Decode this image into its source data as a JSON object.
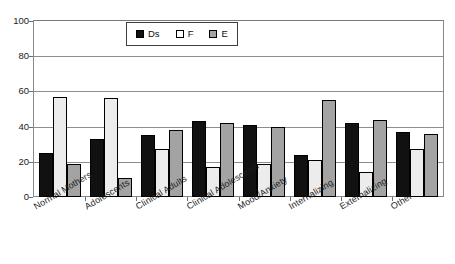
{
  "chart_data": {
    "type": "bar",
    "title": "",
    "xlabel": "",
    "ylabel": "",
    "ylim": [
      0,
      100
    ],
    "yticks": [
      0,
      20,
      40,
      60,
      80,
      100
    ],
    "grid": true,
    "legend_position": "top-center",
    "categories": [
      "Normal Mothers",
      "Adolescents",
      "Clinical Adults",
      "Clinical Adolescents",
      "Mood/Anxiety",
      "Internalizing",
      "Externalizing",
      "Other"
    ],
    "series": [
      {
        "name": "Ds",
        "color": "#111111",
        "values": [
          25,
          33,
          35,
          43,
          41,
          24,
          42,
          37
        ]
      },
      {
        "name": "F",
        "color": "#ececec",
        "values": [
          57,
          56,
          27,
          17,
          19,
          21,
          14,
          27
        ]
      },
      {
        "name": "E",
        "color": "#a3a3a3",
        "values": [
          19,
          11,
          38,
          42,
          40,
          55,
          44,
          36
        ]
      }
    ]
  },
  "legend": {
    "items": [
      {
        "label": "Ds"
      },
      {
        "label": "F"
      },
      {
        "label": "E"
      }
    ]
  },
  "axis": {
    "y_tick_labels": [
      "100",
      "80",
      "60",
      "40",
      "20",
      "0"
    ]
  }
}
